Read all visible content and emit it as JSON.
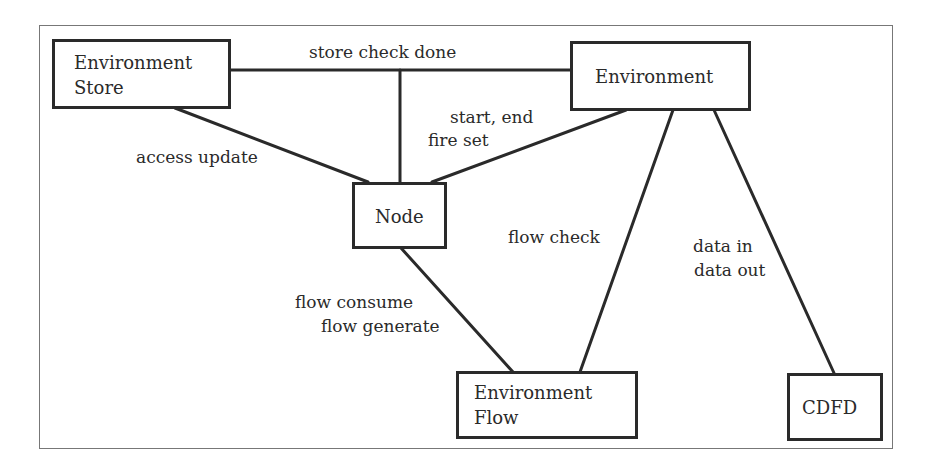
{
  "diagram": {
    "type": "context diagram",
    "nodes": [
      {
        "id": "env_store",
        "line1": "Environment",
        "line2": "Store"
      },
      {
        "id": "environment",
        "line1": "Environment"
      },
      {
        "id": "node",
        "line1": "Node"
      },
      {
        "id": "env_flow",
        "line1": "Environment",
        "line2": "Flow"
      },
      {
        "id": "cdfd",
        "line1": "CDFD"
      }
    ],
    "edges": [
      {
        "from": "env_store",
        "to": "environment",
        "label": "store check done"
      },
      {
        "from": "env_store",
        "to": "node",
        "label": "access update"
      },
      {
        "from": "environment",
        "to": "node",
        "label_line1": "start, end",
        "label_line2": "fire set"
      },
      {
        "from": "environment",
        "to": "env_flow",
        "label": "flow check"
      },
      {
        "from": "environment",
        "to": "cdfd",
        "label_line1": "data in",
        "label_line2": "data out"
      },
      {
        "from": "node",
        "to": "env_flow",
        "label_line1": "flow consume",
        "label_line2": "flow generate"
      }
    ],
    "colors": {
      "stroke": "#2a2a2a",
      "frame": "#777777",
      "background": "#ffffff"
    }
  }
}
